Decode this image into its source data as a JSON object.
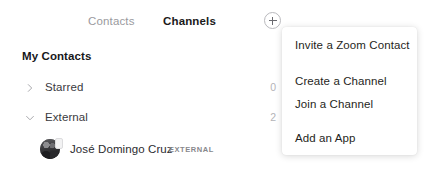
{
  "tabs": [
    {
      "label": "Contacts",
      "active": false
    },
    {
      "label": "Channels",
      "active": true
    }
  ],
  "add_button": {
    "icon": "plus-circle-icon",
    "tooltip": "Add"
  },
  "sidebar": {
    "section_title": "My Contacts",
    "groups": [
      {
        "label": "Starred",
        "count": "0",
        "expanded": false,
        "chevron": "chevron-right-icon"
      },
      {
        "label": "External",
        "count": "2",
        "expanded": true,
        "chevron": "chevron-down-icon"
      }
    ],
    "contacts": [
      {
        "name": "José Domingo Cruz",
        "tag": "EXTERNAL",
        "avatar": "user-photo-avatar"
      }
    ]
  },
  "menu": {
    "items": [
      {
        "label": "Invite a Zoom Contact"
      },
      {
        "label": "Create a Channel"
      },
      {
        "label": "Join a Channel"
      },
      {
        "label": "Add an App"
      }
    ]
  },
  "colors": {
    "background": "#ffffff",
    "text_primary": "#1f1f22",
    "text_muted": "#9a9a9e",
    "count_text": "#b3b3b7",
    "border": "#b9b9bd"
  }
}
